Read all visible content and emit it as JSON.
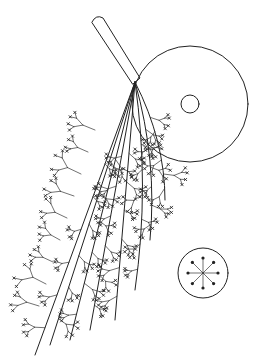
{
  "figure": {
    "colors": {
      "background": "#ffffff",
      "stroke": "#222222"
    },
    "elements": {
      "rod": {
        "label": "stalk"
      },
      "disc": {
        "label": "large disc",
        "inner": "central pore"
      },
      "branches": {
        "label": "branching filaments with cross-marked tips"
      },
      "inset": {
        "label": "cross-section with radiating star",
        "spokes": 8
      }
    }
  }
}
